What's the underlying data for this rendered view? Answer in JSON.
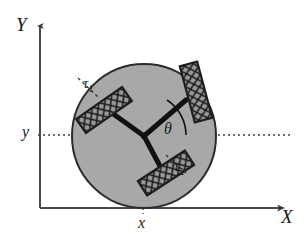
{
  "figure": {
    "kind": "technical-diagram",
    "axes": {
      "x_label": "X",
      "y_label": "Y",
      "origin_x": 40,
      "origin_y": 208,
      "x_axis_end": 288,
      "y_axis_top": 22
    },
    "coordinate_labels": {
      "x_tick": "x",
      "y_tick": "y",
      "x_tick_pos": [
        143,
        226
      ],
      "y_tick_pos": [
        24,
        133
      ]
    },
    "body": {
      "center": [
        144,
        136
      ],
      "radius": 72,
      "fill": "#a8a8a8",
      "stroke": "#2b2b2b"
    },
    "angle": {
      "symbol": "θ",
      "label_pos": [
        166,
        131
      ],
      "arc_radius": 42,
      "from_deg": 0,
      "to_deg": 57
    },
    "torques": [
      {
        "id": "tau1",
        "label": "τ",
        "subscript": "1",
        "label_pos": [
          85,
          83
        ],
        "arm_deg": 177
      },
      {
        "id": "tau2",
        "label": "τ",
        "subscript": "2",
        "label_pos": [
          176,
          166
        ],
        "arm_deg": 303
      }
    ],
    "wheels": [
      {
        "name": "wheel-upper-left",
        "cx": 104,
        "cy": 110,
        "angle_deg": -35,
        "w": 56,
        "h": 17
      },
      {
        "name": "wheel-upper-right",
        "cx": 196,
        "cy": 92,
        "angle_deg": 75,
        "w": 58,
        "h": 18
      },
      {
        "name": "wheel-lower",
        "cx": 166,
        "cy": 173,
        "angle_deg": -33,
        "w": 56,
        "h": 17
      }
    ],
    "arms": [
      {
        "name": "arm-to-wheel-upper-left",
        "to": [
          112,
          113
        ]
      },
      {
        "name": "arm-to-wheel-upper-right",
        "to": [
          186,
          100
        ]
      },
      {
        "name": "arm-to-wheel-lower",
        "to": [
          160,
          168
        ]
      }
    ],
    "guides": {
      "horizontal_dotted_y": 135,
      "horizontal_dotted_from_x": 38,
      "horizontal_dotted_to_x": 292,
      "vertical_dashed_x": 143,
      "vertical_dashed_from_y": 136,
      "vertical_dashed_to_y": 212
    },
    "colors": {
      "body_fill": "#a8a8a8",
      "outline": "#2b2b2b",
      "arm": "#111111",
      "guide": "#4a4a4a",
      "wheel_fill": "#9a9a9a",
      "background": "#ffffff"
    }
  }
}
